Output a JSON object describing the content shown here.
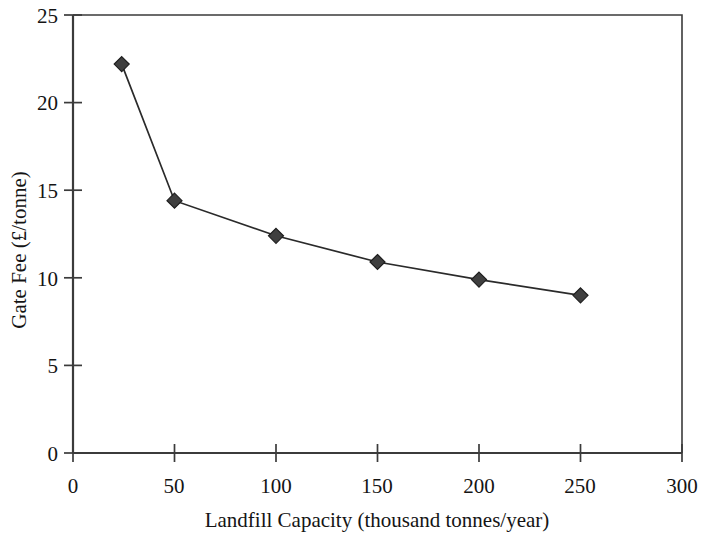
{
  "chart_data": {
    "type": "line",
    "title": "",
    "xlabel": "Landfill Capacity (thousand tonnes/year)",
    "ylabel": "Gate Fee (£/tonne)",
    "xlim": [
      0,
      300
    ],
    "ylim": [
      0,
      25
    ],
    "xticks": [
      0,
      50,
      100,
      150,
      200,
      250,
      300
    ],
    "xtick_labels": [
      "0",
      "50",
      "100",
      "150",
      "200",
      "250",
      "300"
    ],
    "yticks": [
      0,
      5,
      10,
      15,
      20,
      25
    ],
    "ytick_labels": [
      "0",
      "5",
      "10",
      "15",
      "20",
      "25"
    ],
    "grid": false,
    "legend": false,
    "marker": "diamond",
    "marker_color": "#3f3f3f",
    "line_color": "#2a2a2a",
    "x": [
      24,
      50,
      100,
      150,
      200,
      250
    ],
    "values": [
      22.2,
      14.4,
      12.4,
      10.9,
      9.9,
      9.0
    ],
    "series": [
      {
        "name": "Gate Fee",
        "x": [
          24,
          50,
          100,
          150,
          200,
          250
        ],
        "values": [
          22.2,
          14.4,
          12.4,
          10.9,
          9.9,
          9.0
        ]
      }
    ],
    "points": [
      {
        "x": 24,
        "y": 22.2
      },
      {
        "x": 50,
        "y": 14.4
      },
      {
        "x": 100,
        "y": 12.4
      },
      {
        "x": 150,
        "y": 10.9
      },
      {
        "x": 200,
        "y": 9.9
      },
      {
        "x": 250,
        "y": 9.0
      }
    ]
  }
}
